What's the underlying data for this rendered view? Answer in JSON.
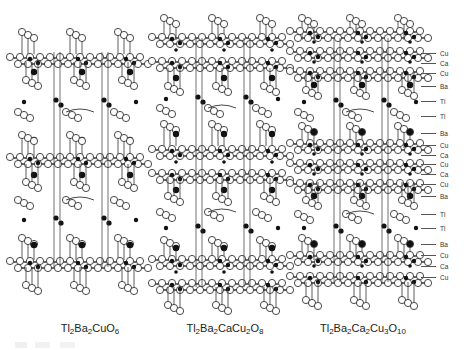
{
  "figure": {
    "structures": [
      {
        "id": "tl2201",
        "formula_parts": [
          [
            "Tl",
            "2"
          ],
          [
            "Ba",
            "2"
          ],
          [
            "Cu",
            ""
          ],
          [
            "O",
            "6"
          ]
        ],
        "caption_x": 90,
        "center_x": 80,
        "layers": [
          {
            "type": "o_top",
            "y": 32
          },
          {
            "type": "cuo2",
            "y": 58
          },
          {
            "type": "o_bot",
            "y": 80
          },
          {
            "type": "ba",
            "y": 72
          },
          {
            "type": "tl",
            "y": 100
          },
          {
            "type": "o_mid",
            "y": 112
          },
          {
            "type": "ba",
            "y": 140
          },
          {
            "type": "o_top",
            "y": 135
          },
          {
            "type": "cuo2",
            "y": 158
          },
          {
            "type": "ba",
            "y": 175
          },
          {
            "type": "o_bot",
            "y": 182
          },
          {
            "type": "o_mid",
            "y": 200
          },
          {
            "type": "tl",
            "y": 218
          },
          {
            "type": "o_top",
            "y": 238
          },
          {
            "type": "ba",
            "y": 245
          },
          {
            "type": "cuo2",
            "y": 262
          },
          {
            "type": "o_bot",
            "y": 285
          }
        ]
      },
      {
        "id": "tl2212",
        "formula_parts": [
          [
            "Tl",
            "2"
          ],
          [
            "Ba",
            "2"
          ],
          [
            "Ca",
            ""
          ],
          [
            "Cu",
            "2"
          ],
          [
            "O",
            "8"
          ]
        ],
        "caption_x": 225,
        "center_x": 222,
        "layers": [
          {
            "type": "o_top",
            "y": 18
          },
          {
            "type": "cuo2",
            "y": 38
          },
          {
            "type": "ca",
            "y": 50
          },
          {
            "type": "cuo2",
            "y": 62
          },
          {
            "type": "o_bot",
            "y": 86
          },
          {
            "type": "ba",
            "y": 78
          },
          {
            "type": "tl",
            "y": 97
          },
          {
            "type": "o_mid",
            "y": 108
          },
          {
            "type": "o_top",
            "y": 124
          },
          {
            "type": "ba",
            "y": 134
          },
          {
            "type": "cuo2",
            "y": 150
          },
          {
            "type": "ca",
            "y": 162
          },
          {
            "type": "cuo2",
            "y": 174
          },
          {
            "type": "ba",
            "y": 190
          },
          {
            "type": "o_bot",
            "y": 196
          },
          {
            "type": "o_mid",
            "y": 212
          },
          {
            "type": "tl",
            "y": 226
          },
          {
            "type": "o_top",
            "y": 240
          },
          {
            "type": "ba",
            "y": 248
          },
          {
            "type": "cuo2",
            "y": 260
          },
          {
            "type": "ca",
            "y": 272
          },
          {
            "type": "cuo2",
            "y": 284
          },
          {
            "type": "o_bot",
            "y": 305
          }
        ]
      },
      {
        "id": "tl2223",
        "formula_parts": [
          [
            "Tl",
            "2"
          ],
          [
            "Ba",
            "2"
          ],
          [
            "Ca",
            "2"
          ],
          [
            "Cu",
            "3"
          ],
          [
            "O",
            "10"
          ]
        ],
        "caption_x": 363,
        "center_x": 360,
        "layers": [
          {
            "type": "o_top",
            "y": 18
          },
          {
            "type": "cuo2",
            "y": 32
          },
          {
            "type": "ca",
            "y": 42
          },
          {
            "type": "cuo2",
            "y": 52
          },
          {
            "type": "ca",
            "y": 62
          },
          {
            "type": "cuo2",
            "y": 72
          },
          {
            "type": "o_bot",
            "y": 90
          },
          {
            "type": "ba",
            "y": 85
          },
          {
            "type": "tl",
            "y": 100
          },
          {
            "type": "o_mid",
            "y": 112
          },
          {
            "type": "o_top",
            "y": 126
          },
          {
            "type": "ba",
            "y": 132
          },
          {
            "type": "cuo2",
            "y": 144
          },
          {
            "type": "ca",
            "y": 154
          },
          {
            "type": "cuo2",
            "y": 164
          },
          {
            "type": "ca",
            "y": 174
          },
          {
            "type": "cuo2",
            "y": 184
          },
          {
            "type": "ba",
            "y": 196
          },
          {
            "type": "o_bot",
            "y": 200
          },
          {
            "type": "o_mid",
            "y": 214
          },
          {
            "type": "tl",
            "y": 226
          },
          {
            "type": "o_top",
            "y": 238
          },
          {
            "type": "ba",
            "y": 244
          },
          {
            "type": "cuo2",
            "y": 256
          },
          {
            "type": "ca",
            "y": 266
          },
          {
            "type": "cuo2",
            "y": 277
          },
          {
            "type": "o_bot",
            "y": 300
          }
        ]
      }
    ],
    "layer_labels": [
      {
        "text": "Cu",
        "y": 53
      },
      {
        "text": "Ca",
        "y": 63
      },
      {
        "text": "Cu",
        "y": 73
      },
      {
        "text": "Ba",
        "y": 86
      },
      {
        "text": "Tl",
        "y": 101
      },
      {
        "text": "Tl",
        "y": 116
      },
      {
        "text": "Ba",
        "y": 133
      },
      {
        "text": "Cu",
        "y": 145
      },
      {
        "text": "Ca",
        "y": 155
      },
      {
        "text": "Cu",
        "y": 164
      },
      {
        "text": "Ca",
        "y": 174
      },
      {
        "text": "Cu",
        "y": 184
      },
      {
        "text": "Ba",
        "y": 196
      },
      {
        "text": "Tl",
        "y": 214
      },
      {
        "text": "Tl",
        "y": 228
      },
      {
        "text": "Ba",
        "y": 244
      },
      {
        "text": "Cu",
        "y": 255
      },
      {
        "text": "Ca",
        "y": 266
      },
      {
        "text": "Cu",
        "y": 277
      }
    ]
  }
}
